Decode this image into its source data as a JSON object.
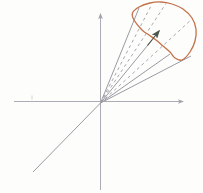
{
  "figure": {
    "name": "cone-over-region-diagram",
    "canvas": {
      "width": 203,
      "height": 193,
      "background": "#fdfdfc"
    },
    "colors": {
      "axis": "#a3a3ab",
      "ray": "#8e8e99",
      "dashed_ray": "#9d9da6",
      "vector": "#4d584c",
      "blob": "#c4714a",
      "tick": "#c6c6cc"
    },
    "origin": {
      "x": 100.5,
      "y": 103
    },
    "axes": {
      "vertical": {
        "x1": 100.5,
        "y1": 190,
        "x2": 100.5,
        "y2": 14
      },
      "horizontal": {
        "x1": 14,
        "y1": 101.5,
        "x2": 183,
        "y2": 101.5
      },
      "oblique": {
        "x1": 33,
        "y1": 172,
        "x2": 100.5,
        "y2": 103
      }
    },
    "axis_tick": {
      "x1": 32,
      "y1": 95.5,
      "x2": 32,
      "y2": 99.5
    },
    "solid_rays": [
      {
        "x": 139,
        "y": 8
      },
      {
        "x": 152,
        "y": 40
      },
      {
        "x": 170,
        "y": 54
      },
      {
        "x": 191,
        "y": 56
      }
    ],
    "dashed_rays": [
      {
        "x": 152,
        "y": 4
      },
      {
        "x": 166,
        "y": 3.5
      },
      {
        "x": 192,
        "y": 19
      }
    ],
    "dash_pattern": "3 3.2",
    "normal_vector": {
      "x1": 147.5,
      "y1": 45.5,
      "x2": 159,
      "y2": 31
    },
    "blob_points": [
      [
        139,
        7
      ],
      [
        150,
        3
      ],
      [
        161,
        2
      ],
      [
        172,
        4
      ],
      [
        183,
        9
      ],
      [
        192,
        18
      ],
      [
        196,
        29
      ],
      [
        195,
        41
      ],
      [
        190,
        52
      ],
      [
        182,
        60
      ],
      [
        175,
        58
      ],
      [
        170,
        52
      ],
      [
        163,
        46
      ],
      [
        156,
        40
      ],
      [
        149,
        35
      ],
      [
        142,
        30
      ],
      [
        134,
        20
      ],
      [
        132.5,
        13
      ]
    ],
    "stroke_widths": {
      "axis": 0.9,
      "ray": 0.9,
      "dashed": 0.9,
      "vector": 1.2,
      "blob": 1.3
    }
  }
}
